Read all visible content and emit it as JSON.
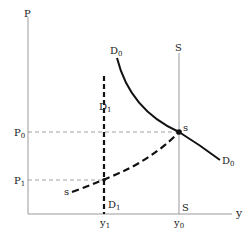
{
  "diagram": {
    "axes": {
      "y_label": "P",
      "x_label": "y"
    },
    "price_levels": [
      {
        "label": "P",
        "sub": "0",
        "name": "p0"
      },
      {
        "label": "P",
        "sub": "1",
        "name": "p1"
      }
    ],
    "quantity_levels": [
      {
        "label": "y",
        "sub": "1",
        "name": "y1"
      },
      {
        "label": "y",
        "sub": "0",
        "name": "y0"
      }
    ],
    "curves": {
      "D0_top": {
        "label": "D",
        "sub": "0"
      },
      "D0_end": {
        "label": "D",
        "sub": "0"
      },
      "D1_top": {
        "label": "D",
        "sub": "1"
      },
      "D1_bottom": {
        "label": "D",
        "sub": "1"
      },
      "S_top": {
        "label": "S"
      },
      "S_bottom": {
        "label": "S"
      },
      "s_left": {
        "label": "s"
      },
      "s_point": {
        "label": "s"
      }
    },
    "colors": {
      "axis": "#999999",
      "curve": "#111111",
      "guide": "#777777"
    }
  }
}
